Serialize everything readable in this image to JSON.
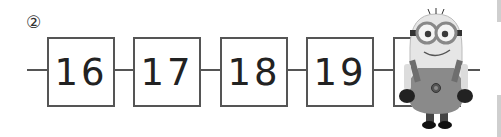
{
  "problem": {
    "number_label": "②"
  },
  "sequence": {
    "boxes": [
      {
        "value": "16"
      },
      {
        "value": "17"
      },
      {
        "value": "18"
      },
      {
        "value": "19"
      },
      {
        "value": ""
      }
    ]
  },
  "illustration": {
    "name": "minion character (grayscale)"
  },
  "colors": {
    "line": "#555555",
    "text": "#222222",
    "background": "#ffffff"
  }
}
